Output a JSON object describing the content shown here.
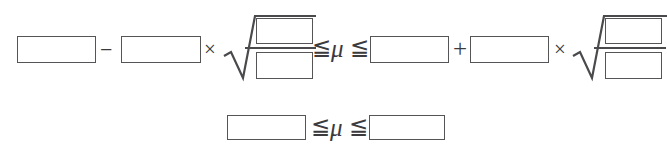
{
  "document": {
    "kind": "math-worksheet-formula-template",
    "background_color": "#ffffff",
    "ink_color": "#4a4a4d",
    "box_border_color": "#555558"
  },
  "symbols": {
    "minus": "−",
    "plus": "+",
    "times": "×",
    "less_or_equal": "≦",
    "mu": "μ",
    "radical": "√"
  },
  "line1": {
    "name": "confidence-interval-expanded",
    "left_expression": {
      "box_mean_lower": "",
      "operator_subtract": "−",
      "box_margin_coefficient_lower": "",
      "operator_multiply": "×",
      "radical": {
        "numerator_box": "",
        "denominator_box": ""
      }
    },
    "relation_left": "≦",
    "parameter": "μ",
    "relation_right": "≦",
    "right_expression": {
      "box_mean_upper": "",
      "operator_add": "+",
      "box_margin_coefficient_upper": "",
      "operator_multiply": "×",
      "radical": {
        "numerator_box": "",
        "denominator_box": ""
      }
    }
  },
  "line2": {
    "name": "confidence-interval-result",
    "box_lower_bound": "",
    "relation_left": "≦",
    "parameter": "μ",
    "relation_right": "≦",
    "box_upper_bound": ""
  }
}
